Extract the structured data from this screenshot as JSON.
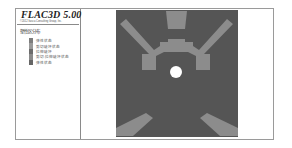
{
  "header": {
    "title": "FLAC3D 5.00",
    "subtitle": "©2012 Itasca Consulting Group, Inc."
  },
  "legend": {
    "heading": "塑性区分布",
    "items": [
      {
        "label": "弹性状态",
        "color": "#7d7d7d"
      },
      {
        "label": "剪切破坏状态",
        "color": "#999999"
      },
      {
        "label": "拉伸破坏",
        "color": "#6c6c6c"
      },
      {
        "label": "剪切-拉伸破坏状态",
        "color": "#8a8a8a"
      },
      {
        "label": "弹性状态",
        "color": "#666666"
      }
    ]
  },
  "plot": {
    "background_color": "#555555",
    "zone_color": "#8c8c8c",
    "opening_color": "#ffffff"
  }
}
